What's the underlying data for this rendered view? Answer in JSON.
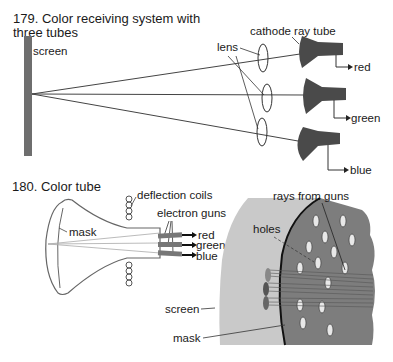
{
  "figure179": {
    "caption_line1": "179. Color receiving system with",
    "caption_line2": "three tubes",
    "labels": {
      "screen": "screen",
      "lens": "lens",
      "cathode_ray_tube": "cathode ray tube",
      "red": "red",
      "green": "green",
      "blue": "blue"
    }
  },
  "figure180": {
    "caption": "180. Color tube",
    "labels": {
      "deflection_coils": "deflection coils",
      "electron_guns": "electron guns",
      "mask": "mask",
      "red": "red",
      "green": "green",
      "blue": "blue",
      "rays_from_guns": "rays from guns",
      "holes": "holes",
      "screen": "screen",
      "mask_detail": "mask"
    }
  },
  "colors": {
    "tube_fill": "#4a4a4a",
    "screen_bar": "#6e6e6e",
    "mask_panel": "#7d7d7d",
    "screen_panel": "#c9c9c9",
    "line": "#333333"
  }
}
